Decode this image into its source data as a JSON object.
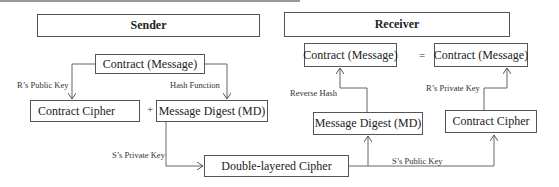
{
  "sender": {
    "title": "Sender",
    "contract_message": "Contract (Message)",
    "contract_cipher": "Contract Cipher",
    "plus": "+",
    "message_digest": "Message Digest (MD)",
    "edge_r_public_key": "R’s Public Key",
    "edge_hash_function": "Hash Function",
    "edge_s_private_key": "S’s Private Key"
  },
  "center": {
    "double_layered_cipher": "Double-layered Cipher"
  },
  "receiver": {
    "title": "Receiver",
    "contract_message_left": "Contract (Message)",
    "equals": "=",
    "contract_message_right": "Contract (Message)",
    "message_digest": "Message Digest (MD)",
    "contract_cipher": "Contract Cipher",
    "edge_reverse_hash": "Reverse Hash",
    "edge_r_private_key": "R’s Private Key",
    "edge_s_public_key": "S’s Public Key"
  }
}
